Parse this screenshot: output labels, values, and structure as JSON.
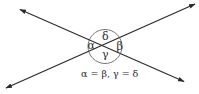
{
  "diagram": {
    "lines": [
      {
        "name": "line-1",
        "from": [
          4,
          89
        ],
        "to": [
          197,
          3
        ]
      },
      {
        "name": "line-2",
        "from": [
          19,
          9
        ],
        "to": [
          186,
          82
        ]
      }
    ],
    "intersection": [
      105,
      46
    ],
    "circle": {
      "cx": 105,
      "cy": 46,
      "r": 17
    },
    "angles": {
      "alpha": "α",
      "beta": "β",
      "gamma": "γ",
      "delta": "δ"
    },
    "equation": "α = β, γ = δ",
    "colors": {
      "stroke": "#2a2a2a",
      "background": "#ffffff"
    }
  }
}
